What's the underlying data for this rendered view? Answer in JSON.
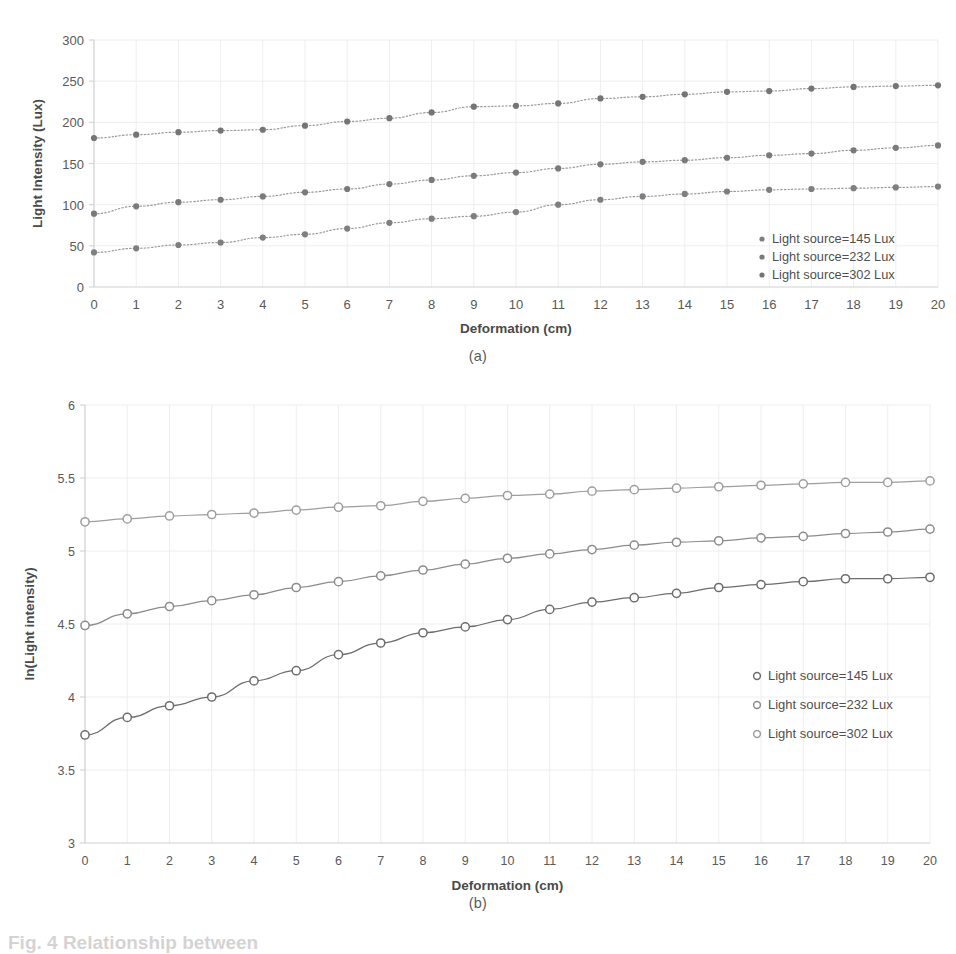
{
  "figure": {
    "caption_partial": "Fig. 4 Relationship between",
    "panels": [
      {
        "id": "a",
        "caption": "(a)"
      },
      {
        "id": "b",
        "caption": "(b)"
      }
    ]
  },
  "chart_data": [
    {
      "panel": "a",
      "type": "scatter",
      "title": "",
      "xlabel": "Deformation (cm)",
      "ylabel": "Light Intensity (Lux)",
      "xlim": [
        0,
        20
      ],
      "ylim": [
        0,
        300
      ],
      "xticks": [
        0,
        1,
        2,
        3,
        4,
        5,
        6,
        7,
        8,
        9,
        10,
        11,
        12,
        13,
        14,
        15,
        16,
        17,
        18,
        19,
        20
      ],
      "yticks": [
        0,
        50,
        100,
        150,
        200,
        250,
        300
      ],
      "grid": true,
      "legend_position": "bottom-right",
      "marker": "filled-circle",
      "trendline": "dotted",
      "x": [
        0,
        1,
        2,
        3,
        4,
        5,
        6,
        7,
        8,
        9,
        10,
        11,
        12,
        13,
        14,
        15,
        16,
        17,
        18,
        19,
        20
      ],
      "series": [
        {
          "name": "Light source=145 Lux",
          "color": "#7f7f7f",
          "values": [
            42,
            47,
            51,
            54,
            60,
            64,
            71,
            78,
            83,
            86,
            91,
            100,
            106,
            110,
            113,
            116,
            118,
            119,
            120,
            121,
            122
          ]
        },
        {
          "name": "Light source=232 Lux",
          "color": "#7a7a7a",
          "values": [
            89,
            98,
            103,
            106,
            110,
            115,
            119,
            125,
            130,
            135,
            139,
            144,
            149,
            152,
            154,
            157,
            160,
            162,
            166,
            169,
            172
          ]
        },
        {
          "name": "Light source=302 Lux",
          "color": "#757575",
          "values": [
            181,
            185,
            188,
            190,
            191,
            196,
            201,
            205,
            212,
            219,
            220,
            223,
            229,
            231,
            234,
            237,
            238,
            241,
            243,
            244,
            245
          ]
        }
      ]
    },
    {
      "panel": "b",
      "type": "line",
      "title": "",
      "xlabel": "Deformation (cm)",
      "ylabel": "ln(Light intensity)",
      "xlim": [
        0,
        20
      ],
      "ylim": [
        3,
        6
      ],
      "xticks": [
        0,
        1,
        2,
        3,
        4,
        5,
        6,
        7,
        8,
        9,
        10,
        11,
        12,
        13,
        14,
        15,
        16,
        17,
        18,
        19,
        20
      ],
      "yticks": [
        3,
        3.5,
        4,
        4.5,
        5,
        5.5,
        6
      ],
      "ytick_labels": [
        "3",
        "3.5",
        "4",
        "4.5",
        "5",
        "5.5",
        "6"
      ],
      "grid": true,
      "legend_position": "center-right",
      "marker": "open-circle",
      "trendline": "solid",
      "x": [
        0,
        1,
        2,
        3,
        4,
        5,
        6,
        7,
        8,
        9,
        10,
        11,
        12,
        13,
        14,
        15,
        16,
        17,
        18,
        19,
        20
      ],
      "series": [
        {
          "name": "Light source=145 Lux",
          "color": "#6d6d6d",
          "values": [
            3.74,
            3.86,
            3.94,
            4.0,
            4.11,
            4.18,
            4.29,
            4.37,
            4.44,
            4.48,
            4.53,
            4.6,
            4.65,
            4.68,
            4.71,
            4.75,
            4.77,
            4.79,
            4.81,
            4.81,
            4.82
          ]
        },
        {
          "name": "Light source=232 Lux",
          "color": "#8c8c8c",
          "values": [
            4.49,
            4.57,
            4.62,
            4.66,
            4.7,
            4.75,
            4.79,
            4.83,
            4.87,
            4.91,
            4.95,
            4.98,
            5.01,
            5.04,
            5.06,
            5.07,
            5.09,
            5.1,
            5.12,
            5.13,
            5.15
          ]
        },
        {
          "name": "Light source=302 Lux",
          "color": "#9e9e9e",
          "values": [
            5.2,
            5.22,
            5.24,
            5.25,
            5.26,
            5.28,
            5.3,
            5.31,
            5.34,
            5.36,
            5.38,
            5.39,
            5.41,
            5.42,
            5.43,
            5.44,
            5.45,
            5.46,
            5.47,
            5.47,
            5.48
          ]
        }
      ]
    }
  ]
}
